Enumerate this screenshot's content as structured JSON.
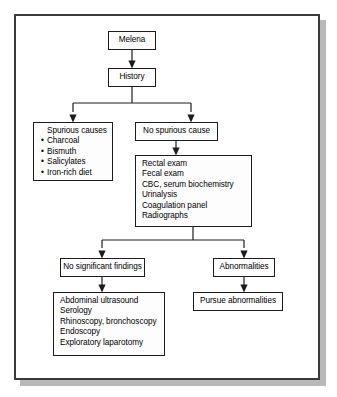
{
  "figure": {
    "kind": "clinical-algorithm-flowchart",
    "accent": "#1c1c1c",
    "frame_color": "#3a3a3a",
    "shadow_color": "#b9b9b9",
    "box_fill": "#fdfdfd"
  },
  "nodes": {
    "melena": {
      "label": "Melena"
    },
    "history": {
      "label": "History"
    },
    "spurious": {
      "heading": "Spurious causes",
      "items": [
        "Charcoal",
        "Bismuth",
        "Salicylates",
        "Iron-rich diet"
      ]
    },
    "no_spurious": {
      "label": "No spurious cause"
    },
    "diagnostics": {
      "items": [
        "Rectal exam",
        "Fecal exam",
        "CBC, serum biochemistry",
        "Urinalysis",
        "Coagulation panel",
        "Radiographs"
      ]
    },
    "no_findings": {
      "label": "No significant findings"
    },
    "abnormalities": {
      "label": "Abnormalities"
    },
    "pursue": {
      "label": "Pursue abnormalities"
    },
    "advanced": {
      "items": [
        "Abdominal ultrasound",
        "Serology",
        "Rhinoscopy, bronchoscopy",
        "Endoscopy",
        "Exploratory laparotomy"
      ]
    }
  },
  "edges": [
    {
      "from": "melena",
      "to": "history"
    },
    {
      "from": "history",
      "to": "spurious"
    },
    {
      "from": "history",
      "to": "no_spurious"
    },
    {
      "from": "no_spurious",
      "to": "diagnostics"
    },
    {
      "from": "diagnostics",
      "to": "no_findings"
    },
    {
      "from": "diagnostics",
      "to": "abnormalities"
    },
    {
      "from": "no_findings",
      "to": "advanced"
    },
    {
      "from": "abnormalities",
      "to": "pursue"
    }
  ]
}
